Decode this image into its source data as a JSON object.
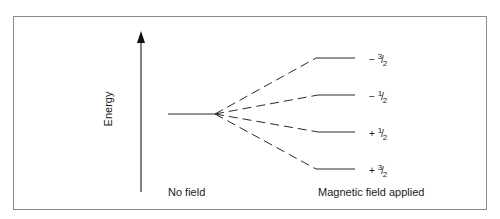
{
  "diagram": {
    "axis_label": "Energy",
    "no_field_label": "No field",
    "field_applied_label": "Magnetic field applied",
    "levels": [
      {
        "sign": "−",
        "numerator": "3",
        "denominator": "2",
        "y": 58
      },
      {
        "sign": "−",
        "numerator": "1",
        "denominator": "2",
        "y": 95
      },
      {
        "sign": "+",
        "numerator": "1",
        "denominator": "2",
        "y": 132
      },
      {
        "sign": "+",
        "numerator": "3",
        "denominator": "2",
        "y": 169
      }
    ],
    "colors": {
      "line": "#2a2a2a",
      "frame": "#8a8a8a",
      "background": "#ffffff"
    }
  }
}
